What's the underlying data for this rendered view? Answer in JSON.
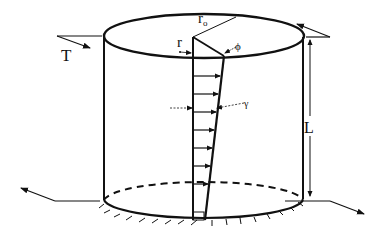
{
  "diagram": {
    "labels": {
      "torque": "T",
      "inner_radius": "r",
      "outer_radius": "r",
      "outer_radius_sub": "o",
      "twist_angle": "ϕ",
      "shear_strain": "γ",
      "length": "L"
    },
    "colors": {
      "ink": "#111111",
      "background": "#ffffff"
    }
  }
}
